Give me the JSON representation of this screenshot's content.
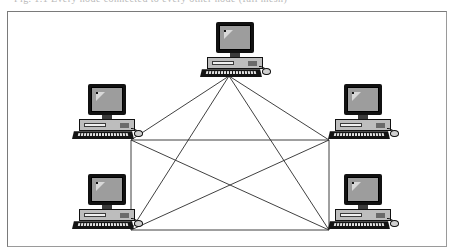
{
  "figure": {
    "caption_fragment": "Fig. 1.1  Every node connected to every other node (full mesh)",
    "border_color": "#7a7a7a",
    "background_color": "#ffffff",
    "line_color": "#2b2b2b"
  },
  "diagram": {
    "type": "network-topology",
    "topology_name": "mesh",
    "node_count": 5,
    "link_count": 10,
    "icon_name": "desktop-computer-icon",
    "nodes": [
      {
        "id": "top",
        "label": "Computer",
        "x": 228,
        "y": 48,
        "port_x": 228,
        "port_y": 75
      },
      {
        "id": "left-upper",
        "label": "Computer",
        "x": 100,
        "y": 110,
        "port_x": 130,
        "port_y": 139
      },
      {
        "id": "right-upper",
        "label": "Computer",
        "x": 356,
        "y": 110,
        "port_x": 328,
        "port_y": 139
      },
      {
        "id": "left-lower",
        "label": "Computer",
        "x": 100,
        "y": 200,
        "port_x": 130,
        "port_y": 229
      },
      {
        "id": "right-lower",
        "label": "Computer",
        "x": 356,
        "y": 200,
        "port_x": 328,
        "port_y": 229
      }
    ],
    "links": [
      {
        "from": "top",
        "to": "left-upper"
      },
      {
        "from": "top",
        "to": "right-upper"
      },
      {
        "from": "top",
        "to": "left-lower"
      },
      {
        "from": "top",
        "to": "right-lower"
      },
      {
        "from": "left-upper",
        "to": "right-upper"
      },
      {
        "from": "left-upper",
        "to": "left-lower"
      },
      {
        "from": "left-upper",
        "to": "right-lower"
      },
      {
        "from": "right-upper",
        "to": "left-lower"
      },
      {
        "from": "right-upper",
        "to": "right-lower"
      },
      {
        "from": "left-lower",
        "to": "right-lower"
      }
    ],
    "colors": {
      "monitor_bezel": "#111111",
      "monitor_screen": "#9d9d9d",
      "case_body": "#bdbdbd",
      "keyboard": "#141414",
      "link": "#2b2b2b"
    }
  }
}
